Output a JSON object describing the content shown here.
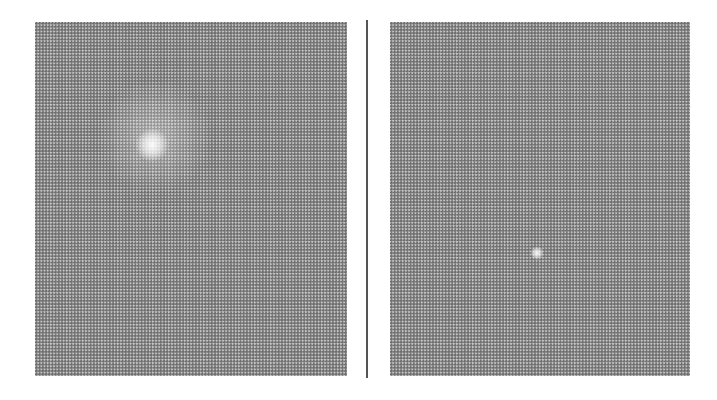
{
  "figure": {
    "panels": [
      {
        "label": "left",
        "features": [
          "bright-spot"
        ]
      },
      {
        "label": "right",
        "features": [
          "small-bright-spot"
        ]
      }
    ],
    "colors": {
      "background": "#ffffff",
      "dot": "#6e6e6e",
      "panel_base": "#c9c9c9",
      "divider": "#555555"
    }
  }
}
